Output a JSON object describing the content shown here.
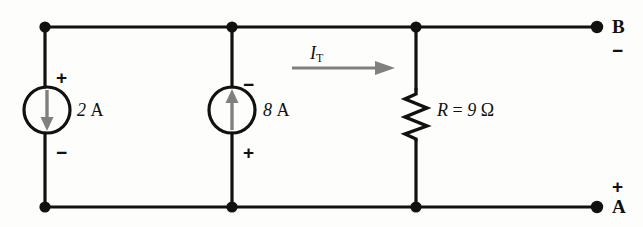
{
  "figure": {
    "type": "electrical-circuit-schematic",
    "background_color": "#fdfdfb",
    "wire_color": "#111111",
    "arrow_color": "#808080"
  },
  "sources": [
    {
      "id": "source-1",
      "kind": "current-source",
      "value_number": "2",
      "value_unit": "A",
      "arrow_direction": "down",
      "top_sign": "+",
      "bottom_sign": "−",
      "cx": 47,
      "cy": 110,
      "radius": 23
    },
    {
      "id": "source-2",
      "kind": "current-source",
      "value_number": "8",
      "value_unit": "A",
      "arrow_direction": "up",
      "top_sign": "−",
      "bottom_sign": "+",
      "cx": 232,
      "cy": 110,
      "radius": 23
    }
  ],
  "resistor": {
    "id": "resistor-R",
    "symbol": "R",
    "equals": "=",
    "value": "9",
    "unit": "Ω",
    "full_label": "R = 9 Ω",
    "x": 416,
    "y_top": 88,
    "y_bottom": 140
  },
  "current_arrow": {
    "id": "total-current",
    "symbol": "I",
    "subscript": "T",
    "full_label": "I_T",
    "direction": "right",
    "color": "#808080"
  },
  "terminals": [
    {
      "id": "terminal-b",
      "name": "B",
      "polarity": "−",
      "x": 597,
      "y": 27,
      "position": "top-right"
    },
    {
      "id": "terminal-a",
      "name": "A",
      "polarity": "+",
      "x": 597,
      "y": 207,
      "position": "bottom-right"
    }
  ],
  "rails": {
    "top_y": 27,
    "bottom_y": 207,
    "left_x": 45,
    "right_x": 597
  },
  "junction_nodes": [
    {
      "id": "node-top-left",
      "x": 45,
      "y": 27
    },
    {
      "id": "node-top-mid",
      "x": 232,
      "y": 27
    },
    {
      "id": "node-top-right",
      "x": 416,
      "y": 27
    },
    {
      "id": "node-bottom-left",
      "x": 45,
      "y": 207
    },
    {
      "id": "node-bottom-mid",
      "x": 232,
      "y": 207
    },
    {
      "id": "node-bottom-right",
      "x": 416,
      "y": 207
    }
  ]
}
